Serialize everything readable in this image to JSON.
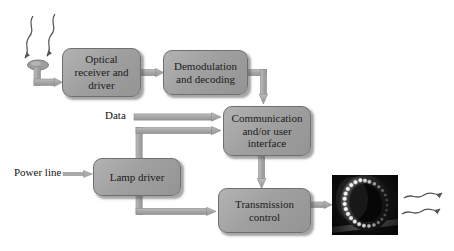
{
  "figure": {
    "background_color": "#ffffff",
    "width": 454,
    "height": 251
  },
  "style": {
    "box_fill": "#a0a0a0",
    "box_border": "#6f6f6f",
    "arrow_fill": "#a6a6a6",
    "arrow_stroke": "#8c8c8c",
    "text_color": "#1b1b1b",
    "photo_background": "#080808",
    "led_color": "#f2f2f2"
  },
  "nodes": [
    {
      "id": "optical-receiver",
      "label": "Optical\nreceiver and\ndriver",
      "label_line1": "Optical",
      "label_line2": "receiver and",
      "label_line3": "driver",
      "x": 62,
      "y": 48,
      "w": 79,
      "h": 49,
      "font_size": 11
    },
    {
      "id": "demodulation",
      "label": "Demodulation\nand decoding",
      "label_line1": "Demodulation",
      "label_line2": "and decoding",
      "label_line3": "",
      "x": 163,
      "y": 50,
      "w": 85,
      "h": 45,
      "font_size": 11
    },
    {
      "id": "communication",
      "label": "Communication\nand/or user\ninterface",
      "label_line1": "Communication",
      "label_line2": "and/or user",
      "label_line3": "interface",
      "x": 223,
      "y": 106,
      "w": 88,
      "h": 50,
      "font_size": 11
    },
    {
      "id": "lamp-driver",
      "label": "Lamp driver",
      "label_line1": "Lamp driver",
      "label_line2": "",
      "label_line3": "",
      "x": 93,
      "y": 158,
      "w": 88,
      "h": 38,
      "font_size": 11
    },
    {
      "id": "transmission-control",
      "label": "Transmission\ncontrol",
      "label_line1": "Transmission",
      "label_line2": "control",
      "label_line3": "",
      "x": 218,
      "y": 188,
      "w": 93,
      "h": 45,
      "font_size": 11
    }
  ],
  "edge_labels": [
    {
      "id": "data-label",
      "text": "Data",
      "x": 105,
      "y": 110,
      "font_size": 11
    },
    {
      "id": "power-line-label",
      "text": "Power line",
      "x": 14,
      "y": 166,
      "font_size": 11
    }
  ],
  "edges": [
    {
      "id": "photodetector-to-optical-receiver",
      "from": "photodetector",
      "to": "optical-receiver",
      "kind": "elbow-thick"
    },
    {
      "id": "optical-receiver-to-demodulation",
      "from": "optical-receiver",
      "to": "demodulation",
      "kind": "straight-thick"
    },
    {
      "id": "demodulation-to-communication",
      "from": "demodulation",
      "to": "communication",
      "kind": "elbow-thick"
    },
    {
      "id": "data-to-communication",
      "from": "data-label",
      "to": "communication",
      "kind": "straight-thick"
    },
    {
      "id": "lamp-driver-to-communication",
      "from": "lamp-driver",
      "to": "communication",
      "kind": "elbow-thick"
    },
    {
      "id": "communication-to-transmission-control",
      "from": "communication",
      "to": "transmission-control",
      "kind": "straight-thick"
    },
    {
      "id": "lamp-driver-to-transmission-control",
      "from": "lamp-driver",
      "to": "transmission-control",
      "kind": "elbow-thick"
    },
    {
      "id": "power-line-to-lamp-driver",
      "from": "power-line-label",
      "to": "lamp-driver",
      "kind": "straight-thin"
    },
    {
      "id": "transmission-control-to-led-array",
      "from": "transmission-control",
      "to": "led-array-photo",
      "kind": "straight-thick"
    }
  ],
  "signals": {
    "incoming": {
      "id": "incoming-light-signal",
      "count": 2,
      "description": "wavy arrows arriving at photodetector"
    },
    "outgoing": {
      "id": "outgoing-light-signal",
      "count": 2,
      "description": "wavy arrows emitted by LED array"
    }
  },
  "photodetector": {
    "id": "photodetector",
    "shape": "ellipse",
    "cx": 38,
    "cy": 65,
    "rx": 10,
    "ry": 5
  },
  "led_array_photo": {
    "id": "led-array-photo",
    "caption": "",
    "x": 332,
    "y": 175,
    "w": 66,
    "h": 60,
    "led_count": 26
  }
}
